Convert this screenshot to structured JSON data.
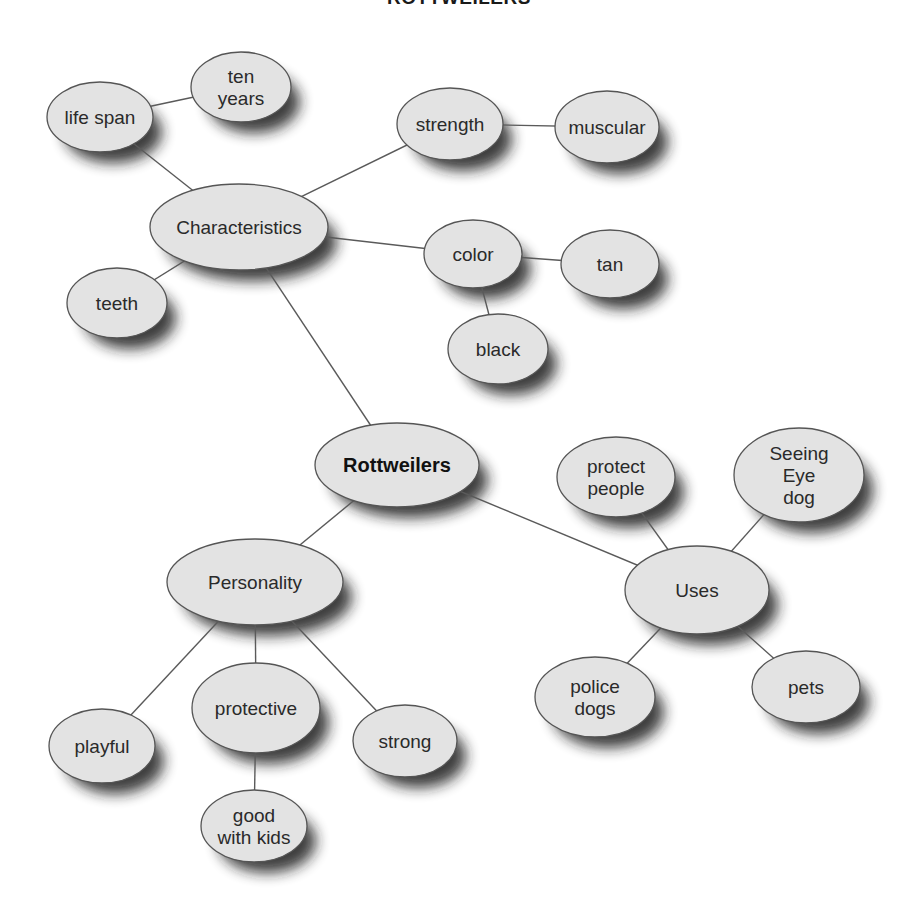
{
  "title": "ROTTWEILERS",
  "colors": {
    "node_fill": "#e3e3e3",
    "node_stroke": "#555555",
    "edge": "#5a5a5a",
    "text": "#2a2a2a",
    "background": "#ffffff"
  },
  "nodes": [
    {
      "id": "rottweilers",
      "lines": [
        "Rottweilers"
      ],
      "cx": 397,
      "cy": 465,
      "rx": 82,
      "ry": 42,
      "bold": true
    },
    {
      "id": "characteristics",
      "lines": [
        "Characteristics"
      ],
      "cx": 239,
      "cy": 227,
      "rx": 89,
      "ry": 43
    },
    {
      "id": "life-span",
      "lines": [
        "life span"
      ],
      "cx": 100,
      "cy": 117,
      "rx": 53,
      "ry": 35
    },
    {
      "id": "ten-years",
      "lines": [
        "ten",
        "years"
      ],
      "cx": 241,
      "cy": 87,
      "rx": 50,
      "ry": 35
    },
    {
      "id": "teeth",
      "lines": [
        "teeth"
      ],
      "cx": 117,
      "cy": 303,
      "rx": 50,
      "ry": 35
    },
    {
      "id": "strength",
      "lines": [
        "strength"
      ],
      "cx": 450,
      "cy": 124,
      "rx": 53,
      "ry": 36
    },
    {
      "id": "muscular",
      "lines": [
        "muscular"
      ],
      "cx": 607,
      "cy": 127,
      "rx": 52,
      "ry": 36
    },
    {
      "id": "color",
      "lines": [
        "color"
      ],
      "cx": 473,
      "cy": 254,
      "rx": 49,
      "ry": 34
    },
    {
      "id": "tan",
      "lines": [
        "tan"
      ],
      "cx": 610,
      "cy": 264,
      "rx": 49,
      "ry": 34
    },
    {
      "id": "black",
      "lines": [
        "black"
      ],
      "cx": 498,
      "cy": 349,
      "rx": 50,
      "ry": 35
    },
    {
      "id": "personality",
      "lines": [
        "Personality"
      ],
      "cx": 255,
      "cy": 582,
      "rx": 88,
      "ry": 43
    },
    {
      "id": "playful",
      "lines": [
        "playful"
      ],
      "cx": 102,
      "cy": 746,
      "rx": 53,
      "ry": 37
    },
    {
      "id": "protective",
      "lines": [
        "protective"
      ],
      "cx": 256,
      "cy": 708,
      "rx": 64,
      "ry": 45
    },
    {
      "id": "strong",
      "lines": [
        "strong"
      ],
      "cx": 405,
      "cy": 741,
      "rx": 52,
      "ry": 36
    },
    {
      "id": "good-with-kids",
      "lines": [
        "good",
        "with kids"
      ],
      "cx": 254,
      "cy": 826,
      "rx": 53,
      "ry": 36
    },
    {
      "id": "uses",
      "lines": [
        "Uses"
      ],
      "cx": 697,
      "cy": 590,
      "rx": 72,
      "ry": 44
    },
    {
      "id": "protect-people",
      "lines": [
        "protect",
        "people"
      ],
      "cx": 616,
      "cy": 477,
      "rx": 59,
      "ry": 40
    },
    {
      "id": "seeing-eye-dog",
      "lines": [
        "Seeing",
        "Eye",
        "dog"
      ],
      "cx": 799,
      "cy": 475,
      "rx": 65,
      "ry": 47
    },
    {
      "id": "police-dogs",
      "lines": [
        "police",
        "dogs"
      ],
      "cx": 595,
      "cy": 697,
      "rx": 60,
      "ry": 40
    },
    {
      "id": "pets",
      "lines": [
        "pets"
      ],
      "cx": 806,
      "cy": 687,
      "rx": 54,
      "ry": 36
    }
  ],
  "edges": [
    [
      "rottweilers",
      "characteristics"
    ],
    [
      "characteristics",
      "life-span"
    ],
    [
      "life-span",
      "ten-years"
    ],
    [
      "characteristics",
      "teeth"
    ],
    [
      "characteristics",
      "strength"
    ],
    [
      "strength",
      "muscular"
    ],
    [
      "characteristics",
      "color"
    ],
    [
      "color",
      "tan"
    ],
    [
      "color",
      "black"
    ],
    [
      "rottweilers",
      "personality"
    ],
    [
      "personality",
      "playful"
    ],
    [
      "personality",
      "protective"
    ],
    [
      "personality",
      "strong"
    ],
    [
      "protective",
      "good-with-kids"
    ],
    [
      "rottweilers",
      "uses"
    ],
    [
      "uses",
      "protect-people"
    ],
    [
      "uses",
      "seeing-eye-dog"
    ],
    [
      "uses",
      "police-dogs"
    ],
    [
      "uses",
      "pets"
    ]
  ]
}
